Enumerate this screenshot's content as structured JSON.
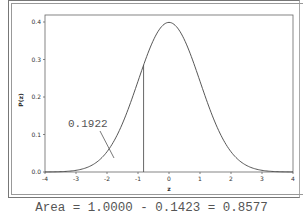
{
  "chart_data": {
    "type": "line",
    "title": "",
    "xlabel": "z",
    "ylabel": "P(z)",
    "xlim": [
      -4,
      4
    ],
    "ylim": [
      0,
      0.4
    ],
    "x_ticks": [
      "-4",
      "-3",
      "-2",
      "-1",
      "0",
      "1",
      "2",
      "3",
      "4"
    ],
    "y_ticks": [
      "0.0",
      "0.1",
      "0.2",
      "0.3",
      "0.4"
    ],
    "series": [
      {
        "name": "Standard normal density",
        "function": "exp(-z^2/2)/sqrt(2*pi)",
        "peak": {
          "x": 0,
          "y": 0.3989
        }
      }
    ],
    "vertical_line": {
      "x": -0.82,
      "y_top": 0.285
    },
    "annotation": {
      "text": "0.1922",
      "points_to": "left tail region"
    },
    "grid": false,
    "legend": null
  },
  "caption": "Area = 1.0000 - 0.1423 = 0.8577"
}
